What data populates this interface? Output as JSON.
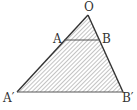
{
  "diagram": {
    "type": "similar-triangles-hatched",
    "points": {
      "O": {
        "label": "O",
        "x": 88,
        "y": 15
      },
      "A": {
        "label": "A",
        "x": 64,
        "y": 40
      },
      "B": {
        "label": "B",
        "x": 100,
        "y": 40
      },
      "A2": {
        "label": "A′",
        "x": 17,
        "y": 92
      },
      "B2": {
        "label": "B′",
        "x": 123,
        "y": 92
      }
    },
    "segments": [
      "O-A'",
      "O-B'",
      "A'-B'",
      "A-B"
    ],
    "fill": "diagonal hatching",
    "colors": {
      "stroke": "#333333",
      "hatch": "#9a9a9a"
    }
  }
}
